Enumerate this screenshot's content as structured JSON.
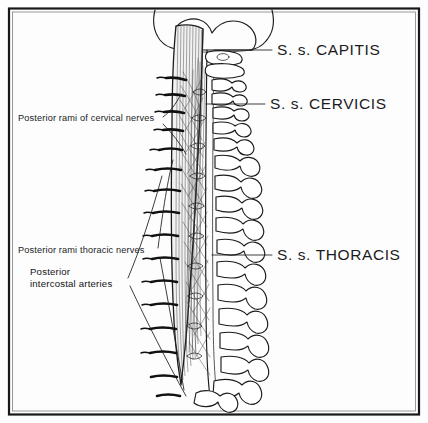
{
  "figure": {
    "background_color": "#fdfdfd",
    "ink_color": "#1b1b1d",
    "frame_color": "#18181a",
    "style": "black-and-white anatomical line drawing"
  },
  "labels": {
    "right": [
      {
        "id": "capitis",
        "text": "S. s. CAPITIS",
        "text_x": 277,
        "text_y": 55,
        "leader_from_x": 214,
        "leader_from_y": 50,
        "leader_to_x": 272,
        "leader_to_y": 50
      },
      {
        "id": "cervicis",
        "text": "S. s. CERVICIS",
        "text_x": 270,
        "text_y": 109,
        "leader_from_x": 206,
        "leader_from_y": 104,
        "leader_to_x": 265,
        "leader_to_y": 104
      },
      {
        "id": "thoracis",
        "text": "S. s. THORACIS",
        "text_x": 277,
        "text_y": 260,
        "leader_from_x": 212,
        "leader_from_y": 255,
        "leader_to_x": 272,
        "leader_to_y": 255
      }
    ],
    "left": [
      {
        "id": "cervical-rami",
        "lines": [
          "Posterior rami of cervical nerves"
        ],
        "text_x": 18,
        "text_y": 121
      },
      {
        "id": "thoracic-rami",
        "lines": [
          "Posterior rami thoracic nerves"
        ],
        "text_x": 18,
        "text_y": 253
      },
      {
        "id": "intercostal-arteries",
        "lines": [
          "Posterior",
          "intercostal arteries"
        ],
        "text_x": 30,
        "text_y": 275
      }
    ]
  },
  "structures": {
    "semispinalis_capitis": "vertically striated muscle belly attaching to the occipital bone",
    "semispinalis_cervicis": "deeper muscle slips in the cervical region",
    "semispinalis_thoracis": "long tendinous slips in the thoracic region",
    "vertebral_column": "cervical and thoracic vertebrae shown in posterior view with spinous and transverse processes",
    "skull": "occipital region of the cranium outlined at the top",
    "posterior_rami": "segmental nerve branches emerging laterally",
    "posterior_intercostal_arteries": "bold segmental arterial branches in the thoracic region"
  },
  "counts": {
    "right_labels": 3,
    "left_labels": 3,
    "segmental_branches": 14
  }
}
